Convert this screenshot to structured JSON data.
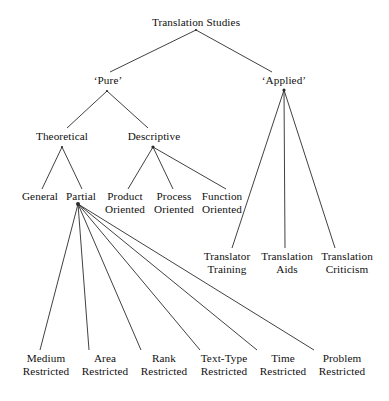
{
  "diagram": {
    "title": "Translation Studies",
    "type": "hierarchical-tree",
    "orientation": "top-down",
    "line_color": "#2b2b2b",
    "text_color": "#101010",
    "background_color": "#ffffff",
    "nodes": {
      "root": {
        "id": "root",
        "label": "Translation  Studies",
        "x": 196,
        "y": 26,
        "anchor": "middle",
        "level": 0
      },
      "pure": {
        "id": "pure",
        "label": "‘Pure’",
        "x": 108,
        "y": 84,
        "anchor": "middle",
        "level": 1
      },
      "applied": {
        "id": "applied",
        "label": "‘Applied’",
        "x": 284,
        "y": 84,
        "anchor": "middle",
        "level": 1
      },
      "theoretical": {
        "id": "theoretical",
        "label": "Theoretical",
        "x": 62,
        "y": 140,
        "anchor": "middle",
        "level": 2
      },
      "descriptive": {
        "id": "descriptive",
        "label": "Descriptive",
        "x": 154,
        "y": 140,
        "anchor": "middle",
        "level": 2
      },
      "general": {
        "id": "general",
        "label": "General",
        "x": 40,
        "y": 200,
        "anchor": "middle",
        "level": 3
      },
      "partial": {
        "id": "partial",
        "label": "Partial",
        "x": 81,
        "y": 200,
        "anchor": "middle",
        "level": 3
      },
      "product_oriented": {
        "id": "product_oriented",
        "line1": "Product",
        "line2": "Oriented",
        "x": 125,
        "y": 200,
        "y2": 213,
        "anchor": "middle",
        "level": 3
      },
      "process_oriented": {
        "id": "process_oriented",
        "line1": "Process",
        "line2": "Oriented",
        "x": 174,
        "y": 200,
        "y2": 213,
        "anchor": "middle",
        "level": 3
      },
      "function_oriented": {
        "id": "function_oriented",
        "line1": "Function",
        "line2": "Oriented",
        "x": 222,
        "y": 200,
        "y2": 213,
        "anchor": "middle",
        "level": 3
      },
      "translator_training": {
        "id": "translator_training",
        "line1": "Translator",
        "line2": "Training",
        "x": 227,
        "y": 260,
        "y2": 273,
        "anchor": "middle",
        "level": 2
      },
      "translation_aids": {
        "id": "translation_aids",
        "line1": "Translation",
        "line2": "Aids",
        "x": 287,
        "y": 260,
        "y2": 273,
        "anchor": "middle",
        "level": 2
      },
      "translation_criticism": {
        "id": "translation_criticism",
        "line1": "Translation",
        "line2": "Criticism",
        "x": 347,
        "y": 260,
        "y2": 273,
        "anchor": "middle",
        "level": 2
      },
      "medium_restricted": {
        "id": "medium_restricted",
        "line1": "Medium",
        "line2": "Restricted",
        "x": 46,
        "y": 362,
        "y2": 375,
        "anchor": "middle",
        "level": 4
      },
      "area_restricted": {
        "id": "area_restricted",
        "line1": "Area",
        "line2": "Restricted",
        "x": 105,
        "y": 362,
        "y2": 375,
        "anchor": "middle",
        "level": 4
      },
      "rank_restricted": {
        "id": "rank_restricted",
        "line1": "Rank",
        "line2": "Restricted",
        "x": 164,
        "y": 362,
        "y2": 375,
        "anchor": "middle",
        "level": 4
      },
      "texttype_restricted": {
        "id": "texttype_restricted",
        "line1": "Text-Type",
        "line2": "Restricted",
        "x": 224,
        "y": 362,
        "y2": 375,
        "anchor": "middle",
        "level": 4
      },
      "time_restricted": {
        "id": "time_restricted",
        "line1": "Time",
        "line2": "Restricted",
        "x": 283,
        "y": 362,
        "y2": 375,
        "anchor": "middle",
        "level": 4
      },
      "problem_restricted": {
        "id": "problem_restricted",
        "line1": "Problem",
        "line2": "Restricted",
        "x": 342,
        "y": 362,
        "y2": 375,
        "anchor": "middle",
        "level": 4
      }
    },
    "joints": [
      {
        "id": "joint-root",
        "x": 196,
        "y": 30,
        "r": 1.1
      },
      {
        "id": "joint-pure",
        "x": 107,
        "y": 91,
        "r": 1.1
      },
      {
        "id": "joint-applied",
        "x": 284,
        "y": 90,
        "r": 1.6
      },
      {
        "id": "joint-theoretical",
        "x": 62,
        "y": 147,
        "r": 1.1
      },
      {
        "id": "joint-descriptive",
        "x": 153,
        "y": 147,
        "r": 1.6
      },
      {
        "id": "joint-partial",
        "x": 78,
        "y": 204,
        "r": 2.0
      }
    ],
    "edges": [
      {
        "id": "root-to-pure",
        "from": "root",
        "to": "pure",
        "x1": 196,
        "y1": 30,
        "x2": 110,
        "y2": 72
      },
      {
        "id": "root-to-applied",
        "from": "root",
        "to": "applied",
        "x1": 196,
        "y1": 30,
        "x2": 272,
        "y2": 72
      },
      {
        "id": "pure-to-theoretical",
        "from": "pure",
        "to": "theoretical",
        "x1": 107,
        "y1": 91,
        "x2": 67,
        "y2": 128
      },
      {
        "id": "pure-to-descriptive",
        "from": "pure",
        "to": "descriptive",
        "x1": 107,
        "y1": 91,
        "x2": 148,
        "y2": 128
      },
      {
        "id": "theoretical-to-general",
        "from": "theoretical",
        "to": "general",
        "x1": 62,
        "y1": 147,
        "x2": 42,
        "y2": 189
      },
      {
        "id": "theoretical-to-partial",
        "from": "theoretical",
        "to": "partial",
        "x1": 62,
        "y1": 147,
        "x2": 82,
        "y2": 189
      },
      {
        "id": "descriptive-to-product",
        "from": "descriptive",
        "to": "product_oriented",
        "x1": 153,
        "y1": 147,
        "x2": 128,
        "y2": 189
      },
      {
        "id": "descriptive-to-process",
        "from": "descriptive",
        "to": "process_oriented",
        "x1": 153,
        "y1": 147,
        "x2": 173,
        "y2": 189
      },
      {
        "id": "descriptive-to-function",
        "from": "descriptive",
        "to": "function_oriented",
        "x1": 153,
        "y1": 147,
        "x2": 226,
        "y2": 189
      },
      {
        "id": "applied-to-translator-training",
        "from": "applied",
        "to": "translator_training",
        "x1": 284,
        "y1": 90,
        "x2": 232,
        "y2": 248
      },
      {
        "id": "applied-to-translation-aids",
        "from": "applied",
        "to": "translation_aids",
        "x1": 284,
        "y1": 90,
        "x2": 285,
        "y2": 248
      },
      {
        "id": "applied-to-translation-criticism",
        "from": "applied",
        "to": "translation_criticism",
        "x1": 284,
        "y1": 90,
        "x2": 335,
        "y2": 248
      },
      {
        "id": "partial-to-medium",
        "from": "partial",
        "to": "medium_restricted",
        "x1": 78,
        "y1": 204,
        "x2": 40,
        "y2": 350
      },
      {
        "id": "partial-to-area",
        "from": "partial",
        "to": "area_restricted",
        "x1": 78,
        "y1": 204,
        "x2": 89,
        "y2": 350
      },
      {
        "id": "partial-to-rank",
        "from": "partial",
        "to": "rank_restricted",
        "x1": 78,
        "y1": 204,
        "x2": 141,
        "y2": 350
      },
      {
        "id": "partial-to-texttype",
        "from": "partial",
        "to": "texttype_restricted",
        "x1": 78,
        "y1": 204,
        "x2": 200,
        "y2": 350
      },
      {
        "id": "partial-to-time",
        "from": "partial",
        "to": "time_restricted",
        "x1": 78,
        "y1": 204,
        "x2": 257,
        "y2": 350
      },
      {
        "id": "partial-to-problem",
        "from": "partial",
        "to": "problem_restricted",
        "x1": 78,
        "y1": 204,
        "x2": 314,
        "y2": 350
      }
    ]
  }
}
